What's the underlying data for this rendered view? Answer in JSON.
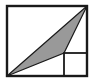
{
  "figure": {
    "width": 93,
    "height": 80,
    "background_color": "#ffffff"
  },
  "colors": {
    "stroke": "#1a1a1a",
    "triangle_fill": "#999999",
    "triangle_stroke": "#1a1a1a",
    "background": "#ffffff"
  },
  "strokes": {
    "outer_square_width": 2.4,
    "inner_square_width": 1.8,
    "triangle_width": 1.2
  },
  "chart_data": {
    "type": "diagram",
    "shapes": [
      {
        "name": "outer-square",
        "type": "rect",
        "x": 7,
        "y": 6,
        "width": 80,
        "height": 70,
        "fill": "none",
        "stroke": "#1a1a1a"
      },
      {
        "name": "inner-square",
        "type": "rect",
        "x": 64,
        "y": 53,
        "width": 23,
        "height": 23,
        "fill": "none",
        "stroke": "#1a1a1a"
      },
      {
        "name": "shaded-triangle",
        "type": "polygon",
        "points": "7,76 87,6 64,53",
        "vertices": [
          {
            "label": "bottom-left-corner",
            "x": 7,
            "y": 76
          },
          {
            "label": "top-right-corner",
            "x": 87,
            "y": 6
          },
          {
            "label": "inner-square-top-left-corner",
            "x": 64,
            "y": 53
          }
        ],
        "fill": "#999999",
        "stroke": "#1a1a1a"
      }
    ],
    "xlabel": "",
    "ylabel": "",
    "grid": false,
    "legend": false
  }
}
